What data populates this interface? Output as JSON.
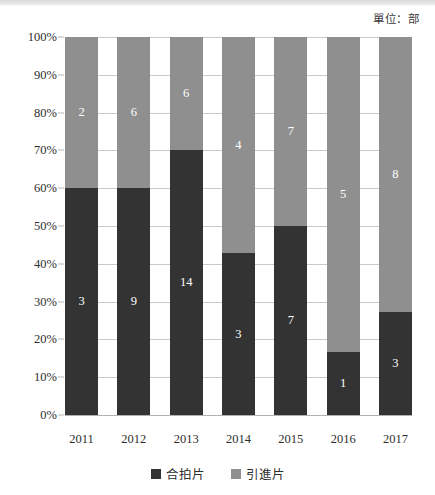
{
  "unit_note": "單位：部",
  "chart_data": {
    "type": "bar",
    "subtype": "100% stacked bar",
    "title": "",
    "subtitle": "",
    "xlabel": "",
    "ylabel": "",
    "unit_note": "單位：部",
    "categories": [
      "2011",
      "2012",
      "2013",
      "2014",
      "2015",
      "2016",
      "2017"
    ],
    "series": [
      {
        "name": "合拍片",
        "color": "#333333",
        "values": [
          3,
          9,
          14,
          3,
          7,
          1,
          3
        ],
        "percents": [
          60.0,
          60.0,
          70.0,
          42.9,
          50.0,
          16.7,
          27.3
        ]
      },
      {
        "name": "引進片",
        "color": "#8f8f8f",
        "values": [
          2,
          6,
          6,
          4,
          7,
          5,
          8
        ],
        "percents": [
          40.0,
          40.0,
          30.0,
          57.1,
          50.0,
          83.3,
          72.7
        ]
      }
    ],
    "totals": [
      5,
      15,
      20,
      7,
      14,
      6,
      11
    ],
    "ylim": [
      0,
      100
    ],
    "yticks": [
      "0%",
      "10%",
      "20%",
      "30%",
      "40%",
      "50%",
      "60%",
      "70%",
      "80%",
      "90%",
      "100%"
    ],
    "ytick_values": [
      0,
      10,
      20,
      30,
      40,
      50,
      60,
      70,
      80,
      90,
      100
    ],
    "grid": true,
    "legend_position": "bottom"
  },
  "legend": {
    "items": [
      {
        "label": "合拍片",
        "color": "#333333"
      },
      {
        "label": "引進片",
        "color": "#8f8f8f"
      }
    ]
  },
  "bars": [
    {
      "category": "2011",
      "light": {
        "value": "2",
        "pct": 40.0
      },
      "dark": {
        "value": "3",
        "pct": 60.0
      }
    },
    {
      "category": "2012",
      "light": {
        "value": "6",
        "pct": 40.0
      },
      "dark": {
        "value": "9",
        "pct": 60.0
      }
    },
    {
      "category": "2013",
      "light": {
        "value": "6",
        "pct": 30.0
      },
      "dark": {
        "value": "14",
        "pct": 70.0
      }
    },
    {
      "category": "2014",
      "light": {
        "value": "4",
        "pct": 57.1
      },
      "dark": {
        "value": "3",
        "pct": 42.9
      }
    },
    {
      "category": "2015",
      "light": {
        "value": "7",
        "pct": 50.0
      },
      "dark": {
        "value": "7",
        "pct": 50.0
      }
    },
    {
      "category": "2016",
      "light": {
        "value": "5",
        "pct": 83.3
      },
      "dark": {
        "value": "1",
        "pct": 16.7
      }
    },
    {
      "category": "2017",
      "light": {
        "value": "8",
        "pct": 72.7
      },
      "dark": {
        "value": "3",
        "pct": 27.3
      }
    }
  ]
}
